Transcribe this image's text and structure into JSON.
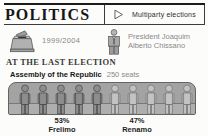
{
  "colors": {
    "rule": "#1c1c1c",
    "muted_text": "#8a8a8a",
    "bench_fill": "#a3a3a3",
    "bench_outline": "#646464",
    "frelimo_figure_fill": "#8d8d8d",
    "frelimo_figure_stroke": "#474747",
    "renamo_figure_fill": "#c3c3c3",
    "renamo_figure_stroke": "#707070"
  },
  "header": {
    "title": "POLITICS",
    "tag_label": "Multiparty elections"
  },
  "facts": {
    "term": "1999/2004",
    "president_line1": "President Joaquim",
    "president_line2": "Alberto Chissano"
  },
  "election": {
    "heading": "AT THE LAST ELECTION",
    "assembly_name": "Assembly of the Republic",
    "seats": "250 seats",
    "parties": [
      {
        "pct": "53%",
        "name": "Frelimo",
        "figures": 5,
        "fill": "#8d8d8d",
        "stroke": "#474747"
      },
      {
        "pct": "47%",
        "name": "Renamo",
        "figures": 5,
        "fill": "#c3c3c3",
        "stroke": "#707070"
      }
    ]
  },
  "chart_data": {
    "type": "bar",
    "title": "Assembly of the Republic",
    "subtitle": "250 seats",
    "categories": [
      "Frelimo",
      "Renamo"
    ],
    "values": [
      53,
      47
    ],
    "unit": "%",
    "total_seats": 250,
    "representation": "pictogram bench of 10 seated figures: 5 dark = Frelimo 53%, 5 light = Renamo 47%",
    "legend_position": "below",
    "annotations": [
      "53% Frelimo",
      "47% Renamo"
    ]
  }
}
